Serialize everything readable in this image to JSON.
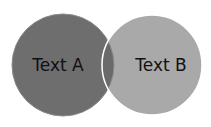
{
  "diagram": {
    "type": "venn",
    "sets": [
      {
        "label": "Text A",
        "color": "#6e6e6e",
        "cx": 63,
        "cy": 65,
        "r": 51
      },
      {
        "label": "Text B",
        "color": "#a9a9a9",
        "cx": 152,
        "cy": 65,
        "r": 50
      }
    ],
    "overlap_color": "#6a6a6a",
    "stroke_color": "#ffffff"
  }
}
